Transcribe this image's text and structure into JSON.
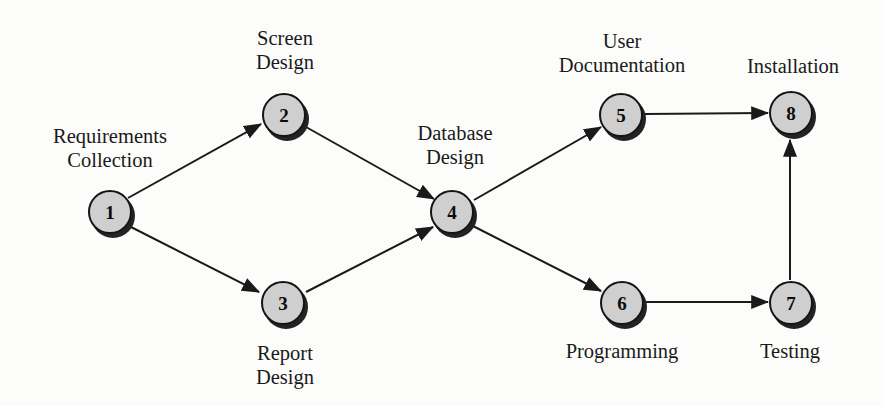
{
  "diagram": {
    "type": "directed-network",
    "background_color": "#fcfcfb",
    "node_fill_color": "#cfcfcf",
    "node_border_color": "#141414",
    "node_shadow_color": "#232323",
    "edge_color": "#1a1a1a",
    "nodes": [
      {
        "id": "1",
        "number": "1",
        "label_lines": [
          "Requirements",
          "Collection"
        ],
        "label_position": "above-left",
        "cx": 110,
        "cy": 212
      },
      {
        "id": "2",
        "number": "2",
        "label_lines": [
          "Screen",
          "Design"
        ],
        "label_position": "above",
        "cx": 284,
        "cy": 115
      },
      {
        "id": "3",
        "number": "3",
        "label_lines": [
          "Report",
          "Design"
        ],
        "label_position": "below",
        "cx": 283,
        "cy": 303
      },
      {
        "id": "4",
        "number": "4",
        "label_lines": [
          "Database",
          "Design"
        ],
        "label_position": "above",
        "cx": 452,
        "cy": 212
      },
      {
        "id": "5",
        "number": "5",
        "label_lines": [
          "User",
          "Documentation"
        ],
        "label_position": "above",
        "cx": 621,
        "cy": 115
      },
      {
        "id": "6",
        "number": "6",
        "label_lines": [
          "Programming"
        ],
        "label_position": "below",
        "cx": 622,
        "cy": 303
      },
      {
        "id": "7",
        "number": "7",
        "label_lines": [
          "Testing"
        ],
        "label_position": "below",
        "cx": 791,
        "cy": 303
      },
      {
        "id": "8",
        "number": "8",
        "label_lines": [
          "Installation"
        ],
        "label_position": "above",
        "cx": 791,
        "cy": 113
      }
    ],
    "edges": [
      {
        "from": "1",
        "to": "2"
      },
      {
        "from": "1",
        "to": "3"
      },
      {
        "from": "2",
        "to": "4"
      },
      {
        "from": "3",
        "to": "4"
      },
      {
        "from": "4",
        "to": "5"
      },
      {
        "from": "4",
        "to": "6"
      },
      {
        "from": "5",
        "to": "8"
      },
      {
        "from": "6",
        "to": "7"
      },
      {
        "from": "7",
        "to": "8"
      }
    ]
  },
  "labels": {
    "node1": {
      "l0": "Requirements",
      "l1": "Collection"
    },
    "node2": {
      "l0": "Screen",
      "l1": "Design"
    },
    "node3": {
      "l0": "Report",
      "l1": "Design"
    },
    "node4": {
      "l0": "Database",
      "l1": "Design"
    },
    "node5": {
      "l0": "User",
      "l1": "Documentation"
    },
    "node6": {
      "l0": "Programming"
    },
    "node7": {
      "l0": "Testing"
    },
    "node8": {
      "l0": "Installation"
    }
  },
  "numbers": {
    "n1": "1",
    "n2": "2",
    "n3": "3",
    "n4": "4",
    "n5": "5",
    "n6": "6",
    "n7": "7",
    "n8": "8"
  }
}
